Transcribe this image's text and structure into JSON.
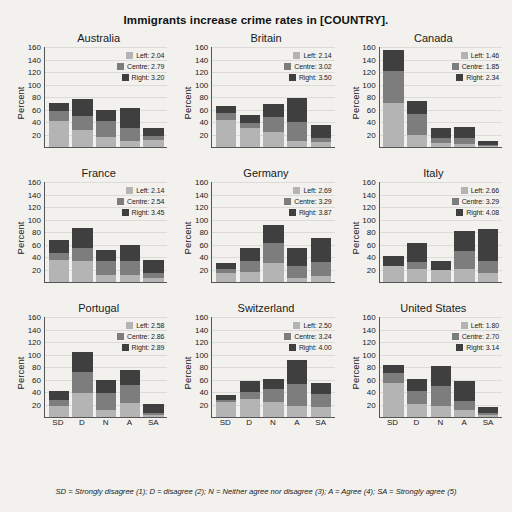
{
  "chart_data": {
    "type": "bar",
    "title": "Immigrants increase crime rates in [COUNTRY].",
    "subtitle": "",
    "xlabel": "",
    "ylabel": "Percent",
    "ylim": [
      0,
      160
    ],
    "yticks": [
      20,
      40,
      60,
      80,
      100,
      120,
      140,
      160
    ],
    "grid": true,
    "legend_position": "top-right inside each panel",
    "stacked": true,
    "categories": [
      "SD",
      "D",
      "N",
      "A",
      "SA"
    ],
    "series_names": [
      "Left",
      "Centre",
      "Right"
    ],
    "series_colors": {
      "Left": "#b4b4b4",
      "Centre": "#7d7d7d",
      "Right": "#3f3f3f"
    },
    "footnote": "SD = Strongly disagree (1); D = disagree (2); N = Neither agree nor disagree (3); A = Agree (4); SA = Strongly agree (5)",
    "panels": [
      {
        "name": "Australia",
        "legend": [
          {
            "label": "Left:",
            "value": "2.04"
          },
          {
            "label": "Centre:",
            "value": "2.79"
          },
          {
            "label": "Right:",
            "value": "3.20"
          }
        ],
        "series": [
          {
            "name": "Left",
            "values": [
              42,
              27,
              16,
              10,
              12
            ]
          },
          {
            "name": "Centre",
            "values": [
              15,
              23,
              25,
              20,
              5
            ]
          },
          {
            "name": "Right",
            "values": [
              14,
              27,
              19,
              33,
              13
            ]
          }
        ],
        "totals": [
          71,
          77,
          60,
          63,
          30
        ]
      },
      {
        "name": "Britain",
        "legend": [
          {
            "label": "Left:",
            "value": "2.14"
          },
          {
            "label": "Centre:",
            "value": "3.02"
          },
          {
            "label": "Right:",
            "value": "3.50"
          }
        ],
        "series": [
          {
            "name": "Left",
            "values": [
              44,
              30,
              24,
              10,
              8
            ]
          },
          {
            "name": "Centre",
            "values": [
              11,
              9,
              24,
              30,
              6
            ]
          },
          {
            "name": "Right",
            "values": [
              11,
              13,
              21,
              39,
              21
            ]
          }
        ],
        "totals": [
          66,
          52,
          69,
          79,
          35
        ]
      },
      {
        "name": "Canada",
        "legend": [
          {
            "label": "Left:",
            "value": "1.46"
          },
          {
            "label": "Centre:",
            "value": "1.85"
          },
          {
            "label": "Right:",
            "value": "2.34"
          }
        ],
        "series": [
          {
            "name": "Left",
            "values": [
              70,
              20,
              6,
              5,
              2
            ]
          },
          {
            "name": "Centre",
            "values": [
              52,
              33,
              8,
              10,
              2
            ]
          },
          {
            "name": "Right",
            "values": [
              33,
              20,
              16,
              17,
              5
            ]
          }
        ],
        "totals": [
          155,
          73,
          30,
          32,
          9
        ]
      },
      {
        "name": "France",
        "legend": [
          {
            "label": "Left:",
            "value": "2.14"
          },
          {
            "label": "Centre:",
            "value": "2.54"
          },
          {
            "label": "Right:",
            "value": "3.45"
          }
        ],
        "series": [
          {
            "name": "Left",
            "values": [
              35,
              33,
              12,
              12,
              7
            ]
          },
          {
            "name": "Centre",
            "values": [
              12,
              21,
              21,
              21,
              7
            ]
          },
          {
            "name": "Right",
            "values": [
              20,
              32,
              18,
              27,
              22
            ]
          }
        ],
        "totals": [
          67,
          86,
          51,
          60,
          36
        ]
      },
      {
        "name": "Germany",
        "legend": [
          {
            "label": "Left:",
            "value": "2.69"
          },
          {
            "label": "Centre:",
            "value": "3.29"
          },
          {
            "label": "Right:",
            "value": "3.87"
          }
        ],
        "series": [
          {
            "name": "Left",
            "values": [
              14,
              16,
              30,
              7,
              9
            ]
          },
          {
            "name": "Centre",
            "values": [
              7,
              18,
              32,
              19,
              23
            ]
          },
          {
            "name": "Right",
            "values": [
              9,
              21,
              29,
              29,
              39
            ]
          }
        ],
        "totals": [
          30,
          55,
          91,
          55,
          71
        ]
      },
      {
        "name": "Italy",
        "legend": [
          {
            "label": "Left:",
            "value": "2.66"
          },
          {
            "label": "Centre:",
            "value": "3.29"
          },
          {
            "label": "Right:",
            "value": "4.08"
          }
        ],
        "series": [
          {
            "name": "Left",
            "values": [
              25,
              21,
              20,
              21,
              14
            ]
          },
          {
            "name": "Centre",
            "values": [
              0,
              11,
              0,
              29,
              20
            ]
          },
          {
            "name": "Right",
            "values": [
              16,
              31,
              13,
              32,
              51
            ]
          }
        ],
        "totals": [
          41,
          63,
          33,
          82,
          85
        ]
      },
      {
        "name": "Portugal",
        "legend": [
          {
            "label": "Left:",
            "value": "2.58"
          },
          {
            "label": "Centre:",
            "value": "2.86"
          },
          {
            "label": "Right:",
            "value": "2.89"
          }
        ],
        "series": [
          {
            "name": "Left",
            "values": [
              17,
              39,
              12,
              23,
              3
            ]
          },
          {
            "name": "Centre",
            "values": [
              10,
              33,
              27,
              29,
              4
            ]
          },
          {
            "name": "Right",
            "values": [
              14,
              32,
              20,
              24,
              14
            ]
          }
        ],
        "totals": [
          41,
          104,
          59,
          76,
          21
        ]
      },
      {
        "name": "Switzerland",
        "legend": [
          {
            "label": "Left:",
            "value": "2.50"
          },
          {
            "label": "Centre:",
            "value": "3.24"
          },
          {
            "label": "Right:",
            "value": "4.00"
          }
        ],
        "series": [
          {
            "name": "Left",
            "values": [
              24,
              29,
              24,
              18,
              16
            ]
          },
          {
            "name": "Centre",
            "values": [
              4,
              11,
              21,
              35,
              21
            ]
          },
          {
            "name": "Right",
            "values": [
              8,
              17,
              16,
              38,
              18
            ]
          }
        ],
        "totals": [
          36,
          57,
          61,
          91,
          55
        ]
      },
      {
        "name": "United States",
        "legend": [
          {
            "label": "Left:",
            "value": "1.80"
          },
          {
            "label": "Centre:",
            "value": "2.70"
          },
          {
            "label": "Right:",
            "value": "3.14"
          }
        ],
        "series": [
          {
            "name": "Left",
            "values": [
              54,
              21,
              18,
              11,
              3
            ]
          },
          {
            "name": "Centre",
            "values": [
              17,
              21,
              31,
              14,
              4
            ]
          },
          {
            "name": "Right",
            "values": [
              13,
              19,
              33,
              33,
              9
            ]
          }
        ],
        "totals": [
          84,
          61,
          82,
          58,
          16
        ]
      }
    ]
  }
}
